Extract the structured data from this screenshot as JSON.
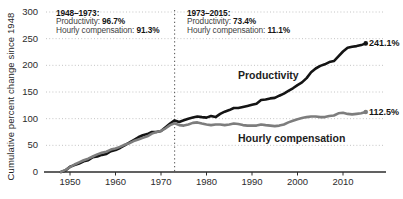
{
  "chart_data": {
    "type": "line",
    "title": "",
    "xlabel": "",
    "ylabel": "Cumulative percent change since 1948",
    "x_start": 1948,
    "x_end": 2015,
    "ylim": [
      0,
      300
    ],
    "y_ticks": [
      0,
      50,
      100,
      150,
      200,
      250,
      300
    ],
    "x_ticks": [
      1950,
      1960,
      1970,
      1980,
      1990,
      2000,
      2010
    ],
    "grid": "dotted-horizontal",
    "reference_line_year": 1973,
    "colors": {
      "productivity_line": "#141414",
      "compensation_line": "#7d7d7d",
      "gridline": "#c4c4c4",
      "reference_line": "#4f4f4f",
      "axis": "#2d2d2d"
    },
    "series": [
      {
        "name": "Productivity",
        "color": "#141414",
        "end_label": "241.1%",
        "values": [
          0,
          3,
          10,
          13,
          16,
          20,
          22,
          28,
          29,
          32,
          34,
          39,
          41,
          45,
          50,
          55,
          60,
          65,
          69,
          71,
          75,
          75,
          77,
          84,
          91,
          96.7,
          94,
          97,
          100,
          102,
          104,
          103,
          102,
          105,
          103,
          109,
          113,
          116,
          120,
          120,
          122,
          124,
          126,
          128,
          135,
          136,
          138,
          139,
          143,
          147,
          152,
          157,
          163,
          168,
          176,
          187,
          194,
          199,
          202,
          206,
          208,
          217,
          226,
          233,
          235,
          236,
          238,
          241.1
        ]
      },
      {
        "name": "Hourly compensation",
        "color": "#7d7d7d",
        "end_label": "112.5%",
        "values": [
          0,
          4,
          9,
          14,
          18,
          22,
          25,
          29,
          33,
          36,
          38,
          42,
          44,
          47,
          51,
          54,
          58,
          61,
          64,
          67,
          72,
          75,
          77,
          82,
          88,
          91.3,
          88,
          87,
          89,
          92,
          93,
          91,
          89,
          88,
          89,
          89,
          88,
          89,
          91,
          90,
          88,
          87,
          87,
          87,
          89,
          88,
          87,
          86,
          87,
          89,
          93,
          96,
          99,
          101,
          103,
          104,
          104,
          103,
          103,
          105,
          106,
          110,
          111,
          109,
          108,
          109,
          110,
          112.5
        ]
      }
    ],
    "annotations": {
      "left": {
        "heading": "1948–1973:",
        "productivity_label": "Productivity:",
        "productivity_value": "96.7%",
        "compensation_label": "Hourly compensation:",
        "compensation_value": "91.3%"
      },
      "right": {
        "heading": "1973–2015:",
        "productivity_label": "Productivity:",
        "productivity_value": "73.4%",
        "compensation_label": "Hourly compensation:",
        "compensation_value": "11.1%"
      }
    }
  }
}
